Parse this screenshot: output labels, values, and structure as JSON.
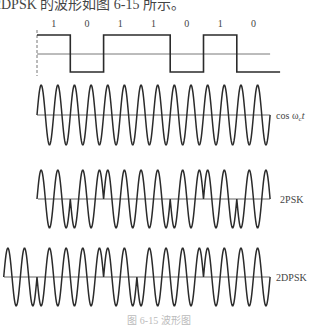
{
  "header_text": "2DPSK 的波形如图 6-15 所示。",
  "caption": "图 6-15  波形图",
  "diagram": {
    "bits": [
      "1",
      "0",
      "1",
      "1",
      "0",
      "1",
      "0"
    ],
    "bit_start_x": 37,
    "bit_width": 33.3,
    "cycles_per_bit": 2,
    "stroke_color": "#2b2b2b",
    "axis_color": "#555555",
    "digital": {
      "high_y": 35,
      "mid_y": 54,
      "low_y": 72,
      "dash_top": 30,
      "dash_bottom": 76,
      "label_y": 27
    },
    "carrier": {
      "label": "cos ωct",
      "label_main": "cos ω",
      "label_sub": "c",
      "label_t": "t",
      "axis_y": 115,
      "amplitude": 30
    },
    "psk": {
      "label": "2PSK",
      "axis_y": 199,
      "amplitude": 29
    },
    "dpsk": {
      "label": "2DPSK",
      "axis_y": 277,
      "amplitude": 29,
      "reference_start_x": 4,
      "reference_phase": 0
    }
  }
}
